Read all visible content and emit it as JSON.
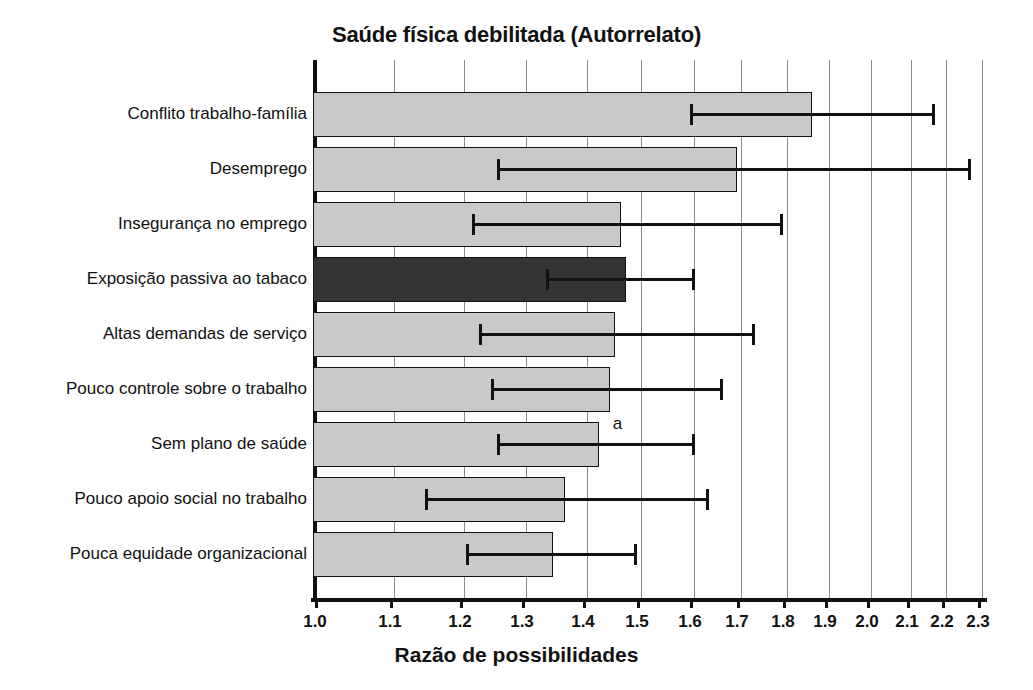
{
  "chart_data": {
    "type": "bar",
    "orientation": "horizontal",
    "title": "Saúde física debilitada (Autorrelato)",
    "xlabel": "Razão de possibilidades",
    "ylabel": "",
    "xscale": "log",
    "xlim": [
      1.0,
      2.35
    ],
    "grid": true,
    "legend": null,
    "xticks": [
      1.0,
      1.1,
      1.2,
      1.3,
      1.4,
      1.5,
      1.6,
      1.7,
      1.8,
      1.9,
      2.0,
      2.1,
      2.2,
      2.3
    ],
    "xticklabels": [
      "1.0",
      "1.1",
      "1.2",
      "1.3",
      "1.4",
      "1.5",
      "1.6",
      "1.7",
      "1.8",
      "1.9",
      "2.0",
      "2.1",
      "2.2",
      "2.3"
    ],
    "categories": [
      "Conflito trabalho-família",
      "Desemprego",
      "Insegurança no emprego",
      "Exposição passiva ao tabaco",
      "Altas demandas de serviço",
      "Pouco controle sobre o trabalho",
      "Sem plano de saúde",
      "Pouco apoio social no trabalho",
      "Pouca equidade organizacional"
    ],
    "values": [
      1.87,
      1.7,
      1.47,
      1.48,
      1.46,
      1.45,
      1.43,
      1.37,
      1.35
    ],
    "ci_low": [
      1.6,
      1.26,
      1.22,
      1.34,
      1.23,
      1.25,
      1.26,
      1.15,
      1.21
    ],
    "ci_high": [
      2.18,
      2.28,
      1.8,
      1.61,
      1.74,
      1.67,
      1.61,
      1.64,
      1.5
    ],
    "highlight_index": 3,
    "bar_colors": {
      "default": "#c9c9c9",
      "highlight": "#343434",
      "edge": "#111111"
    },
    "annotations": [
      {
        "text": "a",
        "category": "Sem plano de saúde",
        "x": 1.455
      }
    ]
  }
}
